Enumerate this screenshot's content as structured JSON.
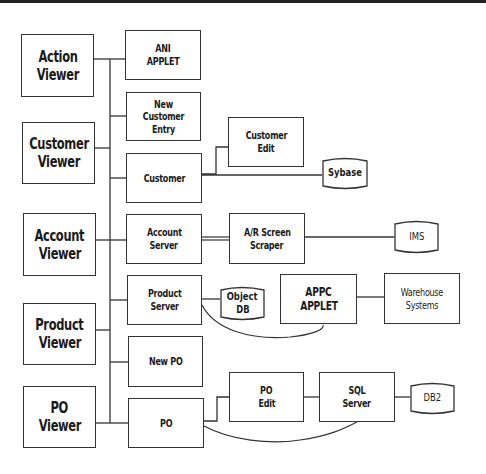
{
  "diagram": {
    "viewers": [
      {
        "id": "action-viewer",
        "lines": [
          "Action",
          "Viewer"
        ]
      },
      {
        "id": "customer-viewer",
        "lines": [
          "Customer",
          "Viewer"
        ]
      },
      {
        "id": "account-viewer",
        "lines": [
          "Account",
          "Viewer"
        ]
      },
      {
        "id": "product-viewer",
        "lines": [
          "Product",
          "Viewer"
        ]
      },
      {
        "id": "po-viewer",
        "lines": [
          "PO",
          "Viewer"
        ]
      }
    ],
    "components": {
      "ani_applet": [
        "ANI",
        "APPLET"
      ],
      "new_customer_entry": [
        "New Customer",
        "Entry"
      ],
      "customer": [
        "Customer"
      ],
      "customer_edit": [
        "Customer",
        "Edit"
      ],
      "account_server": [
        "Account",
        "Server"
      ],
      "ar_screen_scraper": [
        "A/R Screen",
        "Scraper"
      ],
      "product_server": [
        "Product",
        "Server"
      ],
      "appc_applet": [
        "APPC",
        "APPLET"
      ],
      "warehouse_systems": [
        "Warehouse",
        "Systems"
      ],
      "new_po": [
        "New PO"
      ],
      "po": [
        "PO"
      ],
      "po_edit": [
        "PO",
        "Edit"
      ],
      "sql_server": [
        "SQL",
        "Server"
      ]
    },
    "databases": {
      "sybase": [
        "Sybase"
      ],
      "ims": [
        "IMS"
      ],
      "object_db": [
        "Object",
        "DB"
      ],
      "db2": [
        "DB2"
      ]
    }
  }
}
